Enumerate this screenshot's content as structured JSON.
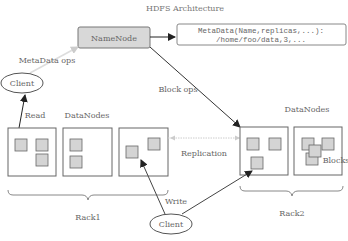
{
  "title": "HDFS Architecture",
  "namenode": {
    "label": "NameNode"
  },
  "metadata": {
    "line1": "MetaData(Name,replicas,...):",
    "line2": "/home/foo/data,3,..."
  },
  "labels": {
    "metadata_ops": "MetaData ops",
    "block_ops": "Block ops",
    "read": "Read",
    "write": "Write",
    "replication": "Replication",
    "blocks": "Blocks"
  },
  "clients": [
    {
      "label": "Client"
    },
    {
      "label": "Client"
    }
  ],
  "racks": [
    {
      "label": "Rack1",
      "datanodes_label": "DataNodes"
    },
    {
      "label": "Rack2",
      "datanodes_label": "DataNodes"
    }
  ],
  "colors": {
    "block_fill": "#d4d4d4",
    "namenode_fill": "#d8d8d8",
    "stroke": "#666666"
  }
}
